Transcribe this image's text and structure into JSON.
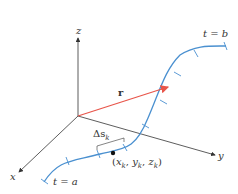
{
  "figure": {
    "axes": {
      "x_label": "x",
      "y_label": "y",
      "z_label": "z"
    },
    "vector_label": "r",
    "curve_start_label": "t = a",
    "curve_end_label": "t = b",
    "arc_segment_label": "Δs",
    "arc_segment_subscript": "k",
    "point_label": "(x_k, y_k, z_k)",
    "point_label_parts": {
      "open": "(",
      "x": "x",
      "y": "y",
      "z": "z",
      "sub": "k",
      "close": ")"
    },
    "colors": {
      "curve": "#4a90d0",
      "vector": "#e8554a",
      "axes": "#333333"
    }
  }
}
